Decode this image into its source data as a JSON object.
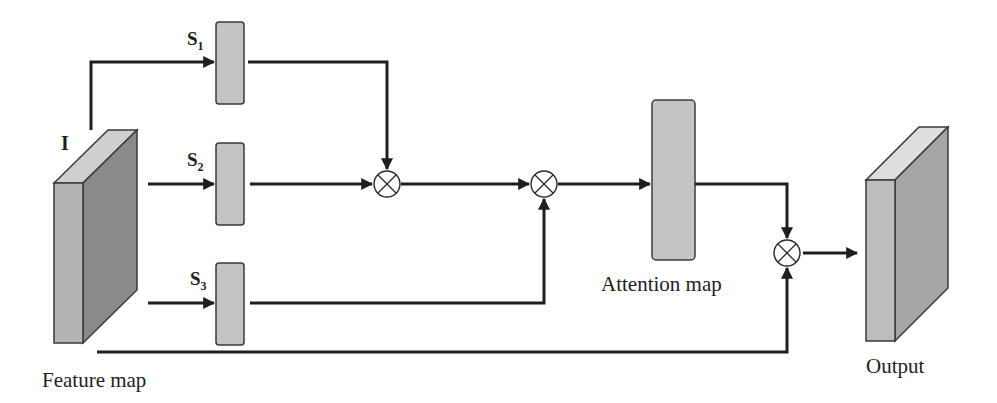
{
  "diagram": {
    "type": "attention-module-flow",
    "nodes": {
      "feature_map": {
        "label": "Feature map",
        "input_symbol": "I"
      },
      "s1": {
        "label": "S",
        "subscript": "1"
      },
      "s2": {
        "label": "S",
        "subscript": "2"
      },
      "s3": {
        "label": "S",
        "subscript": "3"
      },
      "mult1": {
        "symbol": "⊗"
      },
      "mult2": {
        "symbol": "⊗"
      },
      "attention_map": {
        "label": "Attention map"
      },
      "mult3": {
        "symbol": "⊗"
      },
      "output": {
        "label": "Output"
      }
    },
    "edges": [
      {
        "from": "feature_map",
        "to": "s1"
      },
      {
        "from": "feature_map",
        "to": "s2"
      },
      {
        "from": "feature_map",
        "to": "s3"
      },
      {
        "from": "s1",
        "to": "mult1"
      },
      {
        "from": "s2",
        "to": "mult1"
      },
      {
        "from": "mult1",
        "to": "mult2"
      },
      {
        "from": "s3",
        "to": "mult2"
      },
      {
        "from": "mult2",
        "to": "attention_map"
      },
      {
        "from": "attention_map",
        "to": "mult3"
      },
      {
        "from": "feature_map",
        "to": "mult3"
      },
      {
        "from": "mult3",
        "to": "output"
      }
    ],
    "colors": {
      "block_fill": "#c4c4c4",
      "cube_front": "#b4b4b4",
      "cube_side": "#8a8a8a",
      "cube_top": "#cfcfcf",
      "output_front": "#bdbdbd",
      "output_side": "#a6a6a6",
      "output_top": "#dedede",
      "line": "#1e1e1e"
    }
  }
}
